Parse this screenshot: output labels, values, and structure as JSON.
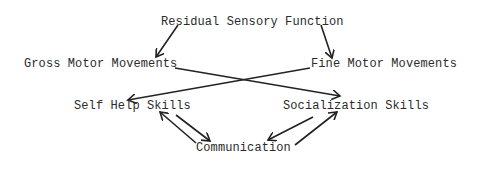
{
  "diagram": {
    "type": "concept-flow",
    "nodes": {
      "residual": {
        "label": "Residual Sensory Function"
      },
      "gross": {
        "label": "Gross Motor Movements"
      },
      "fine": {
        "label": "Fine Motor Movements"
      },
      "selfhelp": {
        "label": "Self Help Skills"
      },
      "social": {
        "label": "Socialization Skills"
      },
      "comm": {
        "label": "Communication"
      }
    },
    "edges": [
      {
        "from": "Residual Sensory Function",
        "to": "Gross Motor Movements",
        "direction": "one-way"
      },
      {
        "from": "Residual Sensory Function",
        "to": "Fine Motor Movements",
        "direction": "one-way"
      },
      {
        "from": "Gross Motor Movements",
        "to": "Socialization Skills",
        "direction": "one-way"
      },
      {
        "from": "Fine Motor Movements",
        "to": "Self Help Skills",
        "direction": "one-way"
      },
      {
        "from": "Self Help Skills",
        "to": "Communication",
        "direction": "two-way"
      },
      {
        "from": "Socialization Skills",
        "to": "Communication",
        "direction": "two-way"
      }
    ],
    "colors": {
      "line": "#222222",
      "text": "#2b2b2b",
      "background": "#ffffff"
    }
  }
}
